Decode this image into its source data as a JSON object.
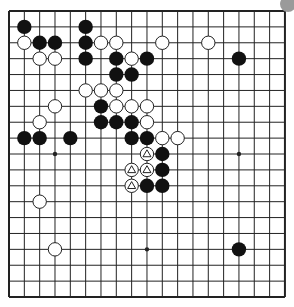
{
  "board": {
    "size": 19,
    "origin_x": 9,
    "origin_y": 11,
    "spacing_x": 15.33,
    "spacing_y": 15.89,
    "line_color": "#222222",
    "background": "#ffffff",
    "star_points": [
      [
        3,
        3
      ],
      [
        9,
        3
      ],
      [
        15,
        3
      ],
      [
        3,
        9
      ],
      [
        9,
        9
      ],
      [
        15,
        9
      ],
      [
        3,
        15
      ],
      [
        9,
        15
      ],
      [
        15,
        15
      ]
    ]
  },
  "stones": {
    "black": [
      [
        1,
        1
      ],
      [
        5,
        1
      ],
      [
        2,
        2
      ],
      [
        3,
        2
      ],
      [
        5,
        2
      ],
      [
        5,
        3
      ],
      [
        7,
        3
      ],
      [
        9,
        3
      ],
      [
        15,
        3
      ],
      [
        7,
        4
      ],
      [
        8,
        4
      ],
      [
        6,
        6
      ],
      [
        6,
        7
      ],
      [
        7,
        7
      ],
      [
        8,
        7
      ],
      [
        1,
        8
      ],
      [
        2,
        8
      ],
      [
        4,
        8
      ],
      [
        8,
        8
      ],
      [
        9,
        8
      ],
      [
        10,
        9
      ],
      [
        10,
        10
      ],
      [
        9,
        11
      ],
      [
        10,
        11
      ],
      [
        15,
        15
      ]
    ],
    "white": [
      [
        1,
        2
      ],
      [
        6,
        2
      ],
      [
        7,
        2
      ],
      [
        10,
        2
      ],
      [
        13,
        2
      ],
      [
        2,
        3
      ],
      [
        3,
        3
      ],
      [
        8,
        3
      ],
      [
        5,
        5
      ],
      [
        6,
        5
      ],
      [
        7,
        5
      ],
      [
        3,
        6
      ],
      [
        7,
        6
      ],
      [
        8,
        6
      ],
      [
        9,
        6
      ],
      [
        2,
        7
      ],
      [
        9,
        7
      ],
      [
        10,
        8
      ],
      [
        11,
        8
      ],
      [
        2,
        12
      ],
      [
        3,
        15
      ]
    ],
    "white_triangle_marked": [
      [
        9,
        9
      ],
      [
        8,
        10
      ],
      [
        9,
        10
      ],
      [
        8,
        11
      ]
    ]
  },
  "colors": {
    "black_stone": "#111111",
    "white_stone_fill": "#ffffff",
    "white_stone_stroke": "#222222",
    "turn_indicator": "#9a9a9a"
  },
  "turn_indicator": {
    "label": "to-play-indicator",
    "x": 288,
    "y": 4,
    "r": 8
  }
}
